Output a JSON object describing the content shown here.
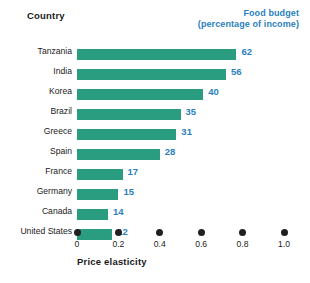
{
  "header": {
    "country_label": "Country",
    "value_header_line1": "Food budget",
    "value_header_line2": "(percentage of income)"
  },
  "axis": {
    "title": "Price elasticity",
    "ticks": [
      "0",
      "0.2",
      "0.4",
      "0.6",
      "0.8",
      "1.0"
    ]
  },
  "colors": {
    "bar": "#2a9c7f",
    "value_text": "#2b7fc0",
    "header_text": "#1a1a1a",
    "tick_dot": "#231f20",
    "background": "#ffffff"
  },
  "chart_data": {
    "type": "bar",
    "orientation": "horizontal",
    "title": "",
    "subtitle": "",
    "xlabel": "Price elasticity",
    "ylabel": "Country",
    "value_label_header": "Food budget (percentage of income)",
    "xlim": [
      0,
      1.0
    ],
    "xticks": [
      0,
      0.2,
      0.4,
      0.6,
      0.8,
      1.0
    ],
    "grid": false,
    "legend": "none",
    "categories": [
      "Tanzania",
      "India",
      "Korea",
      "Brazil",
      "Greece",
      "Spain",
      "France",
      "Germany",
      "Canada",
      "United States"
    ],
    "series": [
      {
        "name": "Price elasticity",
        "values": [
          0.77,
          0.72,
          0.61,
          0.5,
          0.48,
          0.4,
          0.22,
          0.2,
          0.15,
          0.17
        ]
      },
      {
        "name": "Food budget (percentage of income)",
        "values": [
          62,
          56,
          40,
          35,
          31,
          28,
          17,
          15,
          14,
          12
        ]
      }
    ],
    "rows": [
      {
        "country": "Tanzania",
        "price_elasticity": 0.77,
        "food_budget": 62,
        "value_label": "62"
      },
      {
        "country": "India",
        "price_elasticity": 0.72,
        "food_budget": 56,
        "value_label": "56"
      },
      {
        "country": "Korea",
        "price_elasticity": 0.61,
        "food_budget": 40,
        "value_label": "40"
      },
      {
        "country": "Brazil",
        "price_elasticity": 0.5,
        "food_budget": 35,
        "value_label": "35"
      },
      {
        "country": "Greece",
        "price_elasticity": 0.48,
        "food_budget": 31,
        "value_label": "31"
      },
      {
        "country": "Spain",
        "price_elasticity": 0.4,
        "food_budget": 28,
        "value_label": "28"
      },
      {
        "country": "France",
        "price_elasticity": 0.22,
        "food_budget": 17,
        "value_label": "17"
      },
      {
        "country": "Germany",
        "price_elasticity": 0.2,
        "food_budget": 15,
        "value_label": "15"
      },
      {
        "country": "Canada",
        "price_elasticity": 0.15,
        "food_budget": 14,
        "value_label": "14"
      },
      {
        "country": "United States",
        "price_elasticity": 0.17,
        "food_budget": 12,
        "value_label": "12"
      }
    ]
  }
}
